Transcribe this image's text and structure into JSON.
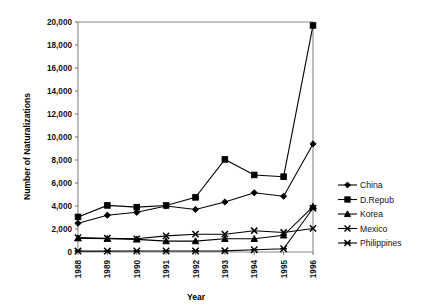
{
  "chart_data": {
    "type": "line",
    "title": "",
    "xlabel": "Year",
    "ylabel": "Number of Naturalizations",
    "categories": [
      "1988",
      "1989",
      "1990",
      "1991",
      "1992",
      "1993",
      "1994",
      "1995",
      "1996"
    ],
    "x_tick_labels": [
      "1988",
      "1989",
      "1990",
      "1991",
      "1992",
      "1993",
      "1994",
      "1995",
      "1996"
    ],
    "y_tick_labels": [
      "0",
      "2,000",
      "4,000",
      "6,000",
      "8,000",
      "10,000",
      "12,000",
      "14,000",
      "16,000",
      "18,000",
      "20,000"
    ],
    "y_ticks": [
      0,
      2000,
      4000,
      6000,
      8000,
      10000,
      12000,
      14000,
      16000,
      18000,
      20000
    ],
    "ylim": [
      0,
      20000
    ],
    "grid": false,
    "legend_position": "right",
    "series": [
      {
        "name": "China",
        "marker": "diamond",
        "values": [
          2500,
          3200,
          3450,
          4000,
          3700,
          4350,
          5150,
          4850,
          9400
        ]
      },
      {
        "name": "D.Repub",
        "marker": "square",
        "values": [
          3050,
          4050,
          3900,
          4050,
          4750,
          8050,
          6700,
          6550,
          19700
        ]
      },
      {
        "name": "Korea",
        "marker": "triangle",
        "values": [
          1200,
          1150,
          1100,
          950,
          950,
          1150,
          1150,
          1450,
          3950
        ]
      },
      {
        "name": "Mexico",
        "marker": "cross",
        "values": [
          1250,
          1200,
          1150,
          1400,
          1550,
          1550,
          1850,
          1700,
          2050
        ]
      },
      {
        "name": "Philippines",
        "marker": "star",
        "values": [
          80,
          80,
          90,
          90,
          90,
          100,
          200,
          280,
          3800
        ]
      }
    ]
  },
  "legend": {
    "entries": [
      {
        "label": "China"
      },
      {
        "label": "D.Repub"
      },
      {
        "label": "Korea"
      },
      {
        "label": "Mexico"
      },
      {
        "label": "Philippines"
      }
    ]
  },
  "axes": {
    "x_title": "Year",
    "y_title": "Number of Naturalizations"
  }
}
